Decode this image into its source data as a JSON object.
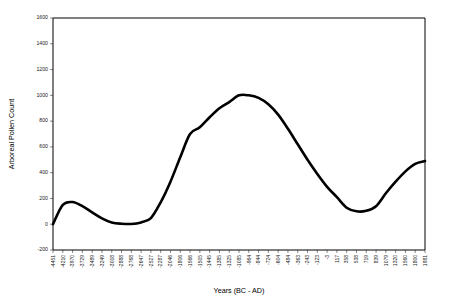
{
  "chart_data": {
    "type": "line",
    "title": "",
    "xlabel": "Years (BC - AD)",
    "ylabel": "Arboreal Pollen Count",
    "ylim": [
      -200,
      1600
    ],
    "yticks": [
      -200,
      0,
      200,
      400,
      600,
      800,
      1000,
      1200,
      1400,
      1600
    ],
    "ytick_labels": [
      "-200",
      "0",
      "200",
      "400",
      "600",
      "800",
      "1000",
      "1200",
      "1400",
      "1600"
    ],
    "grid": false,
    "legend": "none",
    "categories": [
      "-4451",
      "-4210",
      "-3970",
      "-3729",
      "-3489",
      "-3249",
      "-3008",
      "-2888",
      "-2768",
      "-2647",
      "-2527",
      "-2287",
      "-2046",
      "-1806",
      "-1566",
      "-1505",
      "-1445",
      "-1385",
      "-1325",
      "-1085",
      "-964",
      "-844",
      "-724",
      "-604",
      "-484",
      "-363",
      "-243",
      "-123",
      "-3",
      "117",
      "358",
      "538",
      "719",
      "839",
      "1079",
      "1320",
      "1560",
      "1800",
      "1981"
    ],
    "values": [
      0,
      150,
      172,
      140,
      92,
      46,
      14,
      4,
      2,
      14,
      48,
      170,
      330,
      520,
      700,
      752,
      830,
      900,
      948,
      1000,
      1000,
      980,
      930,
      850,
      740,
      620,
      500,
      390,
      290,
      210,
      128,
      100,
      104,
      140,
      240,
      330,
      410,
      468,
      490
    ],
    "series_name": "Arboreal Pollen Count"
  },
  "layout": {
    "plot_left": 53,
    "plot_right": 425,
    "plot_top": 18,
    "plot_bottom": 250
  }
}
